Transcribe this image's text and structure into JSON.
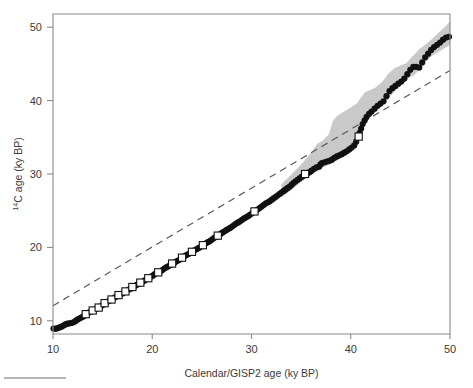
{
  "figure": {
    "title": "",
    "background_color": "#ffffff"
  },
  "axes": {
    "x": {
      "label": "Calendar/GISP2 age (ky BP)",
      "ticks": [
        10,
        20,
        30,
        40,
        50
      ],
      "tick_labels": [
        "10",
        "20",
        "30",
        "40",
        "50"
      ],
      "min": 10,
      "max": 50
    },
    "y": {
      "label_prefix": "",
      "label_superscript": "14",
      "label_main": "C age (ky BP)",
      "label_full": "14C age (ky BP)",
      "ticks": [
        10,
        20,
        30,
        40,
        50
      ],
      "tick_labels": [
        "10",
        "20",
        "30",
        "40",
        "50"
      ],
      "min": 8.2,
      "max": 51.8
    },
    "frame": "box",
    "grid": false
  },
  "colors": {
    "axis": "#8a8a8a",
    "marker_filled": "#111111",
    "marker_open_edge": "#111111",
    "marker_open_fill": "#ffffff",
    "uncertainty_band": "#c9c9c9",
    "reference_line": "#5a5a5a",
    "text": "#3a3a3a"
  },
  "chart_data": {
    "type": "scatter",
    "title": "",
    "xlabel": "Calendar/GISP2 age (ky BP)",
    "ylabel": "14C age (ky BP)",
    "xlim": [
      10,
      50
    ],
    "ylim": [
      8.2,
      51.8
    ],
    "grid": false,
    "legend_position": "none",
    "annotations": [],
    "series": [
      {
        "name": "calibration-points-filled-circles",
        "marker": "filled-circle",
        "marker_size_px": 3.1,
        "points": [
          [
            10.05,
            8.95
          ],
          [
            10.25,
            8.9
          ],
          [
            10.45,
            9.0
          ],
          [
            10.65,
            9.1
          ],
          [
            10.85,
            9.2
          ],
          [
            11.05,
            9.35
          ],
          [
            11.25,
            9.5
          ],
          [
            11.45,
            9.6
          ],
          [
            11.65,
            9.65
          ],
          [
            11.85,
            9.7
          ],
          [
            12.05,
            9.8
          ],
          [
            12.25,
            9.95
          ],
          [
            12.45,
            10.15
          ],
          [
            12.65,
            10.3
          ],
          [
            12.85,
            10.45
          ],
          [
            13.05,
            10.6
          ],
          [
            13.25,
            10.8
          ],
          [
            13.45,
            11.0
          ],
          [
            13.65,
            11.15
          ],
          [
            13.85,
            11.25
          ],
          [
            14.05,
            11.4
          ],
          [
            14.25,
            11.55
          ],
          [
            14.45,
            11.7
          ],
          [
            14.65,
            11.85
          ],
          [
            14.85,
            12.0
          ],
          [
            15.05,
            12.2
          ],
          [
            15.25,
            12.4
          ],
          [
            15.45,
            12.55
          ],
          [
            15.65,
            12.7
          ],
          [
            15.85,
            12.85
          ],
          [
            16.05,
            13.0
          ],
          [
            16.25,
            13.2
          ],
          [
            16.45,
            13.35
          ],
          [
            16.65,
            13.5
          ],
          [
            16.85,
            13.6
          ],
          [
            17.05,
            13.75
          ],
          [
            17.25,
            13.95
          ],
          [
            17.45,
            14.1
          ],
          [
            17.65,
            14.25
          ],
          [
            17.85,
            14.4
          ],
          [
            18.05,
            14.55
          ],
          [
            18.25,
            14.75
          ],
          [
            18.45,
            14.9
          ],
          [
            18.65,
            15.05
          ],
          [
            18.85,
            15.2
          ],
          [
            19.05,
            15.35
          ],
          [
            19.25,
            15.5
          ],
          [
            19.45,
            15.7
          ],
          [
            19.65,
            15.85
          ],
          [
            19.85,
            16.0
          ],
          [
            20.05,
            16.15
          ],
          [
            20.25,
            16.35
          ],
          [
            20.45,
            16.5
          ],
          [
            20.65,
            16.6
          ],
          [
            20.85,
            16.75
          ],
          [
            21.05,
            16.95
          ],
          [
            21.25,
            17.15
          ],
          [
            21.45,
            17.3
          ],
          [
            21.65,
            17.45
          ],
          [
            21.85,
            17.6
          ],
          [
            22.05,
            17.8
          ],
          [
            22.25,
            17.95
          ],
          [
            22.45,
            18.1
          ],
          [
            22.65,
            18.25
          ],
          [
            22.85,
            18.4
          ],
          [
            23.05,
            18.6
          ],
          [
            23.25,
            18.8
          ],
          [
            23.45,
            18.95
          ],
          [
            23.65,
            19.1
          ],
          [
            23.85,
            19.25
          ],
          [
            24.05,
            19.45
          ],
          [
            24.25,
            19.6
          ],
          [
            24.45,
            19.75
          ],
          [
            24.65,
            19.9
          ],
          [
            24.85,
            20.05
          ],
          [
            25.05,
            20.25
          ],
          [
            25.25,
            20.45
          ],
          [
            25.45,
            20.6
          ],
          [
            25.65,
            20.75
          ],
          [
            25.85,
            20.9
          ],
          [
            26.05,
            21.1
          ],
          [
            26.25,
            21.3
          ],
          [
            26.45,
            21.45
          ],
          [
            26.65,
            21.6
          ],
          [
            26.85,
            21.8
          ],
          [
            27.05,
            22.0
          ],
          [
            27.25,
            22.15
          ],
          [
            27.45,
            22.35
          ],
          [
            27.65,
            22.5
          ],
          [
            27.85,
            22.65
          ],
          [
            28.05,
            22.85
          ],
          [
            28.25,
            23.05
          ],
          [
            28.45,
            23.25
          ],
          [
            28.65,
            23.4
          ],
          [
            28.85,
            23.55
          ],
          [
            29.05,
            23.75
          ],
          [
            29.25,
            23.95
          ],
          [
            29.45,
            24.1
          ],
          [
            29.65,
            24.25
          ],
          [
            29.85,
            24.45
          ],
          [
            30.05,
            24.65
          ],
          [
            30.25,
            24.85
          ],
          [
            30.45,
            25.0
          ],
          [
            30.65,
            25.2
          ],
          [
            30.85,
            25.4
          ],
          [
            31.05,
            25.6
          ],
          [
            31.25,
            25.8
          ],
          [
            31.45,
            26.0
          ],
          [
            31.65,
            26.15
          ],
          [
            31.85,
            26.3
          ],
          [
            32.05,
            26.5
          ],
          [
            32.25,
            26.7
          ],
          [
            32.45,
            26.9
          ],
          [
            32.65,
            27.1
          ],
          [
            32.85,
            27.3
          ],
          [
            33.05,
            27.5
          ],
          [
            33.25,
            27.7
          ],
          [
            33.45,
            27.9
          ],
          [
            33.65,
            28.1
          ],
          [
            33.85,
            28.3
          ],
          [
            34.05,
            28.55
          ],
          [
            34.25,
            28.8
          ],
          [
            34.45,
            29.0
          ],
          [
            34.65,
            29.2
          ],
          [
            34.85,
            29.4
          ],
          [
            35.05,
            29.6
          ],
          [
            35.25,
            29.8
          ],
          [
            35.45,
            29.95
          ],
          [
            35.65,
            30.1
          ],
          [
            35.85,
            30.25
          ],
          [
            36.05,
            30.45
          ],
          [
            36.3,
            30.7
          ],
          [
            36.55,
            30.9
          ],
          [
            36.8,
            31.0
          ],
          [
            36.95,
            31.3
          ],
          [
            37.1,
            31.5
          ],
          [
            37.35,
            31.6
          ],
          [
            37.6,
            31.7
          ],
          [
            37.85,
            31.8
          ],
          [
            38.1,
            31.95
          ],
          [
            38.35,
            32.2
          ],
          [
            38.6,
            32.4
          ],
          [
            38.85,
            32.55
          ],
          [
            39.1,
            32.7
          ],
          [
            39.35,
            32.9
          ],
          [
            39.6,
            33.1
          ],
          [
            39.85,
            33.35
          ],
          [
            40.1,
            33.6
          ],
          [
            40.35,
            33.9
          ],
          [
            40.55,
            34.4
          ],
          [
            40.75,
            35.0
          ],
          [
            40.9,
            35.6
          ],
          [
            41.05,
            36.2
          ],
          [
            41.2,
            36.8
          ],
          [
            41.4,
            37.3
          ],
          [
            41.6,
            37.8
          ],
          [
            41.85,
            38.2
          ],
          [
            42.1,
            38.5
          ],
          [
            42.4,
            38.9
          ],
          [
            42.7,
            39.3
          ],
          [
            43.0,
            39.6
          ],
          [
            43.3,
            39.9
          ],
          [
            43.6,
            40.6
          ],
          [
            43.9,
            41.3
          ],
          [
            44.2,
            41.7
          ],
          [
            44.5,
            42.0
          ],
          [
            44.8,
            42.3
          ],
          [
            45.1,
            42.6
          ],
          [
            45.4,
            43.0
          ],
          [
            45.7,
            43.6
          ],
          [
            46.0,
            44.2
          ],
          [
            46.3,
            44.6
          ],
          [
            46.6,
            44.6
          ],
          [
            46.9,
            44.5
          ],
          [
            47.2,
            45.2
          ],
          [
            47.5,
            45.9
          ],
          [
            47.8,
            46.4
          ],
          [
            48.1,
            46.9
          ],
          [
            48.4,
            47.3
          ],
          [
            48.7,
            47.6
          ],
          [
            49.0,
            47.9
          ],
          [
            49.3,
            48.3
          ],
          [
            49.6,
            48.6
          ],
          [
            49.9,
            48.7
          ]
        ]
      },
      {
        "name": "calibration-points-open-squares",
        "marker": "open-square",
        "marker_size_px": 7.2,
        "points": [
          [
            13.3,
            10.9
          ],
          [
            14.0,
            11.4
          ],
          [
            14.6,
            11.8
          ],
          [
            15.2,
            12.4
          ],
          [
            15.9,
            12.9
          ],
          [
            16.6,
            13.5
          ],
          [
            17.3,
            14.0
          ],
          [
            18.0,
            14.6
          ],
          [
            18.8,
            15.2
          ],
          [
            19.6,
            15.8
          ],
          [
            20.6,
            16.6
          ],
          [
            22.0,
            17.8
          ],
          [
            23.0,
            18.6
          ],
          [
            24.0,
            19.4
          ],
          [
            25.1,
            20.3
          ],
          [
            26.6,
            21.6
          ],
          [
            30.3,
            24.9
          ],
          [
            35.4,
            30.0
          ],
          [
            40.8,
            35.1
          ]
        ]
      }
    ],
    "reference_line": {
      "name": "one-to-one-line",
      "style": "dashed",
      "points": [
        [
          10,
          12.05
        ],
        [
          50,
          44.1
        ]
      ],
      "description": "dashed straight reference line"
    },
    "uncertainty_band": {
      "name": "gray-uncertainty-envelope",
      "fill": "#c9c9c9",
      "upper": [
        [
          33.0,
          28.6
        ],
        [
          34.0,
          29.9
        ],
        [
          35.0,
          31.3
        ],
        [
          36.0,
          32.9
        ],
        [
          36.6,
          34.1
        ],
        [
          37.2,
          34.6
        ],
        [
          37.8,
          35.4
        ],
        [
          38.2,
          37.2
        ],
        [
          38.6,
          37.9
        ],
        [
          39.2,
          38.4
        ],
        [
          39.8,
          38.9
        ],
        [
          40.6,
          39.6
        ],
        [
          41.4,
          41.1
        ],
        [
          41.9,
          41.4
        ],
        [
          42.5,
          41.8
        ],
        [
          43.2,
          42.6
        ],
        [
          43.8,
          43.7
        ],
        [
          44.4,
          44.4
        ],
        [
          45.0,
          44.8
        ],
        [
          45.6,
          45.1
        ],
        [
          46.2,
          46.0
        ],
        [
          46.9,
          47.0
        ],
        [
          47.5,
          47.6
        ],
        [
          48.2,
          48.4
        ],
        [
          48.9,
          49.3
        ],
        [
          49.6,
          50.2
        ],
        [
          50.0,
          50.8
        ]
      ],
      "lower": [
        [
          50.0,
          47.6
        ],
        [
          49.4,
          47.1
        ],
        [
          48.8,
          46.6
        ],
        [
          48.2,
          46.1
        ],
        [
          47.6,
          45.4
        ],
        [
          47.0,
          44.3
        ],
        [
          46.4,
          43.5
        ],
        [
          45.8,
          43.0
        ],
        [
          45.2,
          42.3
        ],
        [
          44.6,
          41.5
        ],
        [
          44.0,
          40.6
        ],
        [
          43.4,
          39.7
        ],
        [
          42.8,
          38.8
        ],
        [
          42.2,
          38.1
        ],
        [
          41.6,
          37.2
        ],
        [
          41.0,
          35.9
        ],
        [
          40.4,
          34.3
        ],
        [
          39.8,
          32.9
        ],
        [
          39.0,
          32.2
        ],
        [
          38.2,
          31.5
        ],
        [
          37.4,
          31.0
        ],
        [
          36.6,
          30.4
        ],
        [
          35.8,
          29.7
        ],
        [
          35.0,
          28.9
        ],
        [
          34.2,
          28.0
        ],
        [
          33.4,
          27.2
        ],
        [
          33.0,
          26.8
        ]
      ]
    }
  }
}
